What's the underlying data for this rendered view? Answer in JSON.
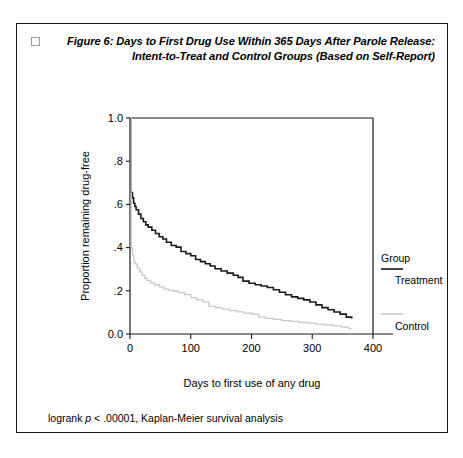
{
  "figure": {
    "marker": "",
    "title_line1": "Figure 6: Days to First Drug Use Within 365 Days After Parole Release:",
    "title_line2": "Intent-to-Treat and Control Groups (Based on Self-Report)",
    "footnote_prefix": "logrank ",
    "footnote_italic": "p",
    "footnote_suffix": " < .00001, Kaplan-Meier survival analysis"
  },
  "legend": {
    "heading": "Group",
    "treatment_label": "Treatment",
    "control_label": "Control",
    "treatment_color": "#1a1a1a",
    "control_color": "#c8c8c8"
  },
  "chart_data": {
    "type": "line",
    "title": "Figure 6: Days to First Drug Use Within 365 Days After Parole Release: Intent-to-Treat and Control Groups (Based on Self-Report)",
    "xlabel": "Days to first use of any drug",
    "ylabel": "Proportion remaining drug-free",
    "xlim": [
      0,
      400
    ],
    "ylim": [
      0.0,
      1.0
    ],
    "grid": false,
    "legend_position": "right",
    "xticks": [
      0,
      100,
      200,
      300,
      400
    ],
    "xtick_labels": [
      "0",
      "100",
      "200",
      "300",
      "400"
    ],
    "yticks": [
      0.0,
      0.2,
      0.4,
      0.6,
      0.8,
      1.0
    ],
    "ytick_labels": [
      "0.0",
      ".2",
      ".4",
      ".6",
      ".8",
      "1.0"
    ],
    "annotation": "logrank p < .00001, Kaplan-Meier survival analysis",
    "series": [
      {
        "name": "Treatment",
        "color": "#1a1a1a",
        "step": "post",
        "x": [
          0,
          2,
          4,
          6,
          8,
          10,
          14,
          18,
          22,
          26,
          30,
          36,
          42,
          48,
          54,
          60,
          68,
          76,
          84,
          92,
          100,
          108,
          116,
          124,
          132,
          140,
          150,
          160,
          170,
          178,
          186,
          196,
          206,
          216,
          226,
          236,
          246,
          256,
          266,
          276,
          286,
          296,
          306,
          316,
          326,
          336,
          346,
          356,
          365
        ],
        "y": [
          1.0,
          0.655,
          0.63,
          0.605,
          0.59,
          0.575,
          0.555,
          0.535,
          0.52,
          0.505,
          0.495,
          0.48,
          0.465,
          0.45,
          0.44,
          0.425,
          0.41,
          0.402,
          0.382,
          0.372,
          0.362,
          0.345,
          0.335,
          0.325,
          0.315,
          0.302,
          0.292,
          0.282,
          0.272,
          0.262,
          0.245,
          0.235,
          0.228,
          0.222,
          0.215,
          0.205,
          0.193,
          0.182,
          0.172,
          0.165,
          0.158,
          0.148,
          0.135,
          0.122,
          0.112,
          0.102,
          0.092,
          0.078,
          0.072
        ]
      },
      {
        "name": "Control",
        "color": "#c8c8c8",
        "step": "post",
        "x": [
          0,
          2,
          4,
          6,
          8,
          12,
          16,
          20,
          24,
          28,
          34,
          40,
          48,
          56,
          64,
          72,
          80,
          90,
          100,
          110,
          120,
          130,
          140,
          152,
          164,
          176,
          188,
          200,
          212,
          224,
          236,
          250,
          264,
          278,
          292,
          306,
          320,
          334,
          348,
          360,
          365
        ],
        "y": [
          1.0,
          0.4,
          0.365,
          0.34,
          0.325,
          0.305,
          0.288,
          0.272,
          0.258,
          0.248,
          0.238,
          0.228,
          0.218,
          0.208,
          0.202,
          0.198,
          0.192,
          0.182,
          0.168,
          0.158,
          0.148,
          0.128,
          0.122,
          0.115,
          0.108,
          0.102,
          0.097,
          0.092,
          0.078,
          0.072,
          0.068,
          0.062,
          0.058,
          0.054,
          0.05,
          0.046,
          0.042,
          0.038,
          0.032,
          0.024,
          0.022
        ]
      }
    ]
  }
}
